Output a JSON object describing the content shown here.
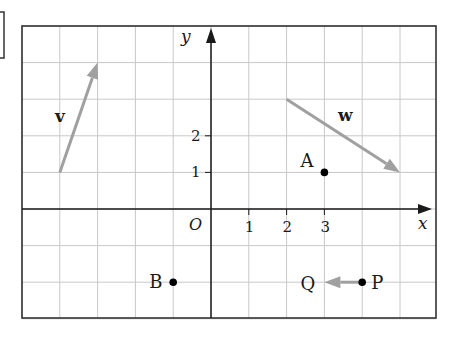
{
  "diagram": {
    "type": "coordinate-grid",
    "origin_label": "O",
    "x_axis_label": "x",
    "y_axis_label": "y",
    "x_range": [
      -5,
      5.6
    ],
    "y_range": [
      -3,
      5
    ],
    "x_ticks": [
      {
        "value": 1,
        "label": "1"
      },
      {
        "value": 2,
        "label": "2"
      },
      {
        "value": 3,
        "label": "3"
      }
    ],
    "y_ticks": [
      {
        "value": 1,
        "label": "1"
      },
      {
        "value": 2,
        "label": "2"
      }
    ],
    "vectors": [
      {
        "name": "v",
        "label": "v",
        "from": [
          -4,
          1
        ],
        "to": [
          -3,
          4
        ],
        "color": "#a0a0a0"
      },
      {
        "name": "w",
        "label": "w",
        "from": [
          2,
          3
        ],
        "to": [
          5,
          1
        ],
        "color": "#a0a0a0"
      },
      {
        "name": "PQ",
        "label": "",
        "from": [
          4,
          -2
        ],
        "to": [
          3,
          -2
        ],
        "color": "#a0a0a0"
      }
    ],
    "points": [
      {
        "label": "A",
        "x": 3,
        "y": 1
      },
      {
        "label": "B",
        "x": -1,
        "y": -2
      },
      {
        "label": "P",
        "x": 4,
        "y": -2
      },
      {
        "label": "Q",
        "x": 3,
        "y": -2,
        "dot": false
      }
    ],
    "colors": {
      "grid": "#c8c8c8",
      "axis": "#1a1a1a",
      "border": "#333333",
      "vector": "#a0a0a0",
      "point": "#000000"
    }
  }
}
